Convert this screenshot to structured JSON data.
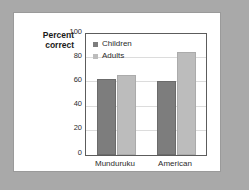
{
  "figure": {
    "background_color": "#a9a9a9",
    "panel_color": "#ffffff"
  },
  "chart_data": {
    "type": "bar",
    "title": "",
    "xlabel": "",
    "ylabel": "Percent correct",
    "ylim": [
      0,
      100
    ],
    "ytick_step": 20,
    "yticks": [
      100,
      80,
      60,
      40,
      20,
      0
    ],
    "ytick_labels": [
      "100",
      "80",
      "60",
      "40",
      "20",
      "0"
    ],
    "grid": true,
    "grid_color": "#dcdcdc",
    "legend_position": "upper-left-inside",
    "categories": [
      "Munduruku",
      "American"
    ],
    "series": [
      {
        "name": "Children",
        "color": "#7d7d7d",
        "values": [
          63,
          61.5
        ]
      },
      {
        "name": "Adults",
        "color": "#bcbcbc",
        "values": [
          66,
          85
        ]
      }
    ]
  }
}
